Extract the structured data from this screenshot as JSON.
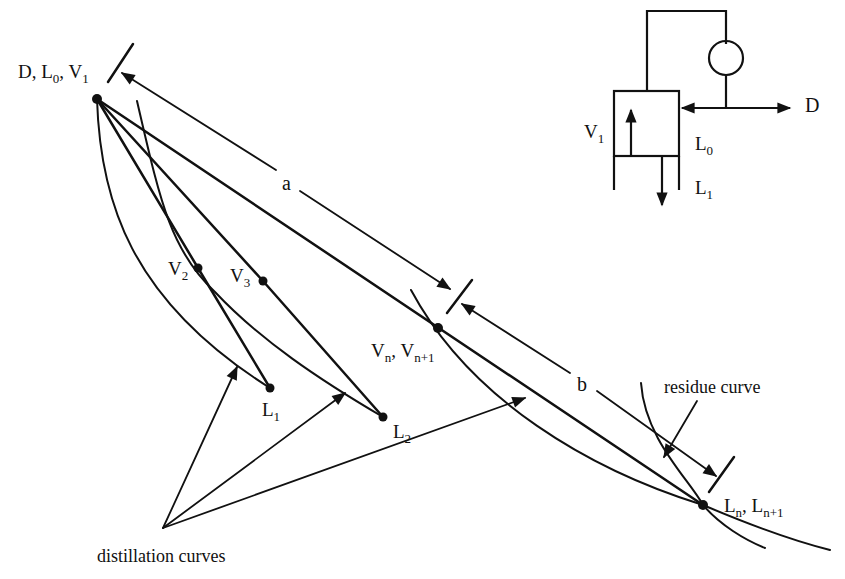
{
  "figure": {
    "type": "distillation column profile on composition triangle with residue and distillation curves",
    "colors": {
      "ink": "#111111",
      "background": "#ffffff"
    }
  },
  "labels": {
    "top_point": {
      "main": "D, L",
      "sub0": "0",
      "sep": ", V",
      "sub1": "1"
    },
    "v2": {
      "main": "V",
      "sub": "2"
    },
    "v3": {
      "main": "V",
      "sub": "3"
    },
    "l1": {
      "main": "L",
      "sub": "1"
    },
    "l2": {
      "main": "L",
      "sub": "2"
    },
    "vn": {
      "main1": "V",
      "sub1": "n",
      "sep": ", V",
      "sub2": "n+1"
    },
    "ln": {
      "main1": "L",
      "sub1": "n",
      "sep": ", L",
      "sub2": "n+1"
    },
    "a": "a",
    "b": "b",
    "residue_curve": "residue curve",
    "distillation_curves": "distillation curves"
  },
  "inset": {
    "v1": {
      "main": "V",
      "sub": "1"
    },
    "l0": {
      "main": "L",
      "sub": "0"
    },
    "l1": {
      "main": "L",
      "sub": "1"
    },
    "d": "D"
  },
  "points": [
    {
      "name": "D, L0, V1",
      "x": 97,
      "y": 99
    },
    {
      "name": "V2",
      "x": 198,
      "y": 268
    },
    {
      "name": "V3",
      "x": 263,
      "y": 281
    },
    {
      "name": "L1",
      "x": 270,
      "y": 388
    },
    {
      "name": "L2",
      "x": 383,
      "y": 417
    },
    {
      "name": "Vn, Vn+1",
      "x": 438,
      "y": 328
    },
    {
      "name": "Ln, Ln+1",
      "x": 703,
      "y": 505
    }
  ]
}
